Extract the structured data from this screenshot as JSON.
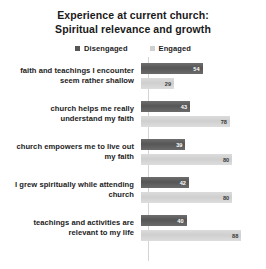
{
  "chart_data": {
    "type": "bar",
    "orientation": "horizontal",
    "title": "Experience at current church: Spiritual relevance and growth",
    "title_lines": [
      "Experience at current church:",
      "Spiritual relevance and growth"
    ],
    "xlabel": "",
    "ylabel": "",
    "xlim": [
      0,
      100
    ],
    "grid": false,
    "legend_position": "top-center",
    "colors": {
      "disengaged": "#565656",
      "engaged": "#cfcfcf"
    },
    "categories": [
      "faith and teachings I encounter seem rather shallow",
      "church helps me really understand my faith",
      "church empowers me to live out my faith",
      "I grew spiritually while attending church",
      "teachings and activities are relevant to my life"
    ],
    "category_lines": [
      [
        "faith and teachings I encounter",
        "seem rather shallow"
      ],
      [
        "church helps me really",
        "understand my faith"
      ],
      [
        "church empowers me to live out",
        "my faith"
      ],
      [
        "I grew spiritually while attending",
        "church"
      ],
      [
        "teachings and activities are",
        "relevant to my life"
      ]
    ],
    "series": [
      {
        "name": "Disengaged",
        "values": [
          54,
          43,
          39,
          42,
          40
        ]
      },
      {
        "name": "Engaged",
        "values": [
          29,
          78,
          80,
          80,
          88
        ]
      }
    ]
  },
  "legend": {
    "items": [
      {
        "label": "Disengaged",
        "color": "#565656"
      },
      {
        "label": "Engaged",
        "color": "#cfcfcf"
      }
    ]
  }
}
